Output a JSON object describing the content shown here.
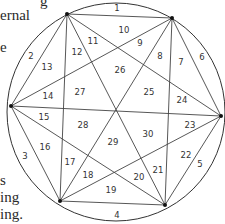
{
  "page_text_fragments": [
    {
      "text": "g",
      "x": 40,
      "y": -6
    },
    {
      "text": "ernal",
      "x": 0,
      "y": 8
    },
    {
      "text": "e",
      "x": 0,
      "y": 40
    },
    {
      "text": "s",
      "x": 0,
      "y": 173
    },
    {
      "text": "ing",
      "x": 0,
      "y": 190
    },
    {
      "text": "ing.",
      "x": 0,
      "y": 207
    }
  ],
  "diagram": {
    "circle": {
      "cx": 116,
      "cy": 112,
      "r": 109
    },
    "vertices": [
      {
        "name": "top-left",
        "x": 67,
        "y": 14
      },
      {
        "name": "top-right",
        "x": 172,
        "y": 18
      },
      {
        "name": "right",
        "x": 221,
        "y": 116
      },
      {
        "name": "bottom-right",
        "x": 165,
        "y": 205
      },
      {
        "name": "bottom-left",
        "x": 60,
        "y": 201
      },
      {
        "name": "left",
        "x": 11,
        "y": 106
      }
    ],
    "region_labels": [
      {
        "n": "1",
        "x": 117,
        "y": 8
      },
      {
        "n": "2",
        "x": 31,
        "y": 56
      },
      {
        "n": "3",
        "x": 25,
        "y": 156
      },
      {
        "n": "4",
        "x": 117,
        "y": 215
      },
      {
        "n": "5",
        "x": 200,
        "y": 164
      },
      {
        "n": "6",
        "x": 202,
        "y": 57
      },
      {
        "n": "7",
        "x": 181,
        "y": 62
      },
      {
        "n": "8",
        "x": 160,
        "y": 56
      },
      {
        "n": "9",
        "x": 140,
        "y": 43
      },
      {
        "n": "10",
        "x": 124,
        "y": 30
      },
      {
        "n": "11",
        "x": 93,
        "y": 41
      },
      {
        "n": "12",
        "x": 77,
        "y": 52
      },
      {
        "n": "13",
        "x": 47,
        "y": 67
      },
      {
        "n": "14",
        "x": 48,
        "y": 96
      },
      {
        "n": "15",
        "x": 44,
        "y": 117
      },
      {
        "n": "16",
        "x": 45,
        "y": 147
      },
      {
        "n": "17",
        "x": 70,
        "y": 162
      },
      {
        "n": "18",
        "x": 88,
        "y": 175
      },
      {
        "n": "19",
        "x": 111,
        "y": 190
      },
      {
        "n": "20",
        "x": 139,
        "y": 177
      },
      {
        "n": "21",
        "x": 158,
        "y": 170
      },
      {
        "n": "22",
        "x": 186,
        "y": 155
      },
      {
        "n": "23",
        "x": 190,
        "y": 125
      },
      {
        "n": "24",
        "x": 182,
        "y": 100
      },
      {
        "n": "25",
        "x": 149,
        "y": 92
      },
      {
        "n": "26",
        "x": 120,
        "y": 70
      },
      {
        "n": "27",
        "x": 80,
        "y": 92
      },
      {
        "n": "28",
        "x": 83,
        "y": 125
      },
      {
        "n": "29",
        "x": 113,
        "y": 142
      },
      {
        "n": "30",
        "x": 148,
        "y": 134
      }
    ]
  }
}
